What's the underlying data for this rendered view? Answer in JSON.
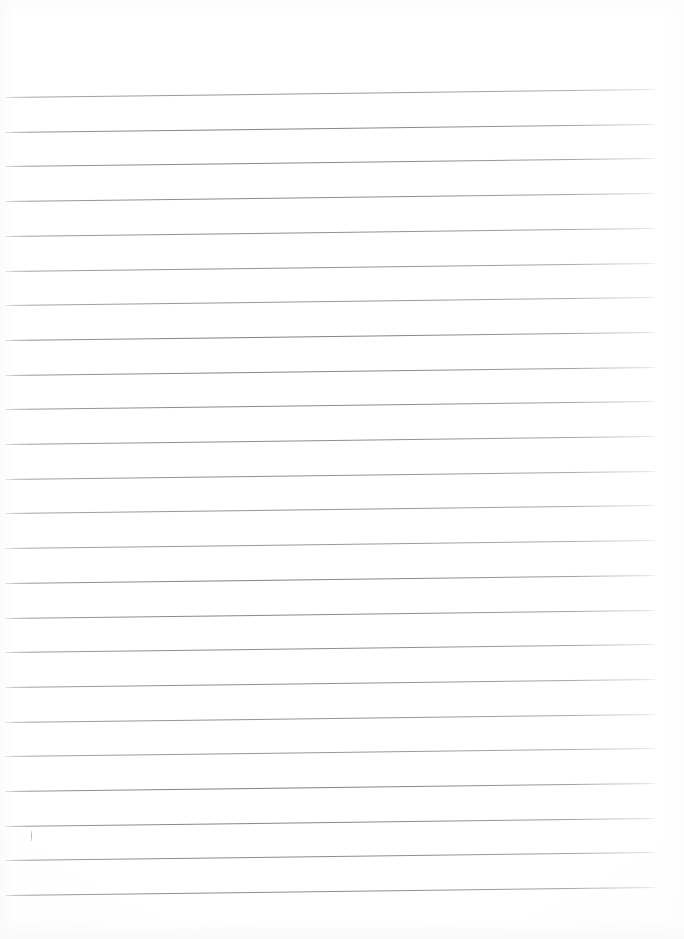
{
  "document": {
    "kind": "scanned-ruled-paper",
    "title": "Blank Ruled Notebook Page",
    "page_width": 684,
    "page_height": 939,
    "background_color": "#ffffff",
    "rule_color": "#85858a",
    "content_text": ""
  },
  "ruling": {
    "line_count": 24,
    "first_line_y": 97,
    "line_spacing": 34.7,
    "line_start_x": 5,
    "line_end_x": 656,
    "line_thickness": 1,
    "skew_rise_px": 8,
    "top_margin": 97,
    "bottom_margin": 33,
    "right_margin": 28,
    "left_margin": 5
  },
  "marks": [
    {
      "name": "tick-mark",
      "x": 31,
      "y": 830,
      "width": 1,
      "height": 11,
      "color": "#96969b"
    }
  ]
}
